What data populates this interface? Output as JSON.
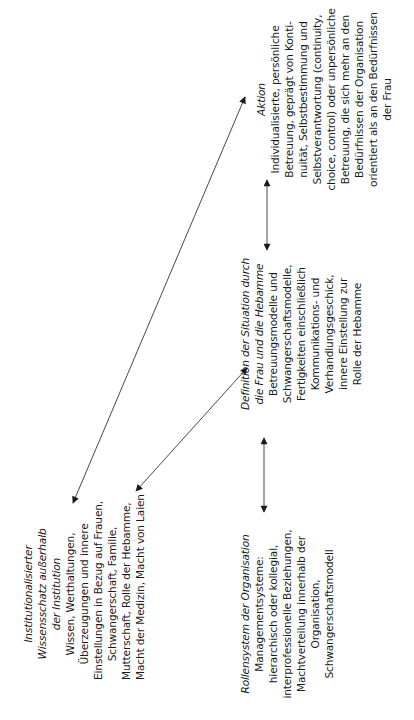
{
  "figure": {
    "orientation": "rotated -90deg (landscape figure printed sideways)",
    "nodes": {
      "institutional_knowledge": {
        "title_lines": [
          "Institutionalisierter",
          "Wissensschatz außerhalb",
          "der Institution"
        ],
        "body_lines": [
          "Wissen, Werthaltungen,",
          "Überzeugungen und innere",
          "Einstellungen in Bezug auf Frauen,",
          "Schwangerschaft, Familie,",
          "Mutterschaft, Rolle der Hebamme,",
          "Macht der Medizin, Macht von Laien"
        ]
      },
      "role_system": {
        "title_lines": [
          "Rollensystem der Organisation"
        ],
        "body_lines": [
          "Managementsysteme:",
          "hierarchisch oder kollegial,",
          "interprofessionelle Beziehungen,",
          "Machtverteilung innerhalb der",
          "Organisation,",
          "Schwangerschaftsmodell"
        ]
      },
      "definition": {
        "title_lines": [
          "Definition der Situation durch",
          "die Frau und die Hebamme"
        ],
        "body_lines": [
          "Betreuungsmodelle und",
          "Schwangerschaftsmodelle,",
          "Fertigkeiten einschließlich",
          "Kommunikations- und",
          "Verhandlungsgeschick,",
          "innere Einstellung zur",
          "Rolle der Hebamme"
        ]
      },
      "action": {
        "title_lines": [
          "Aktion"
        ],
        "body_lines": [
          "Individualisierte, persönliche",
          "Betreuung, geprägt von Konti-",
          "nuität, Selbstbestimmung und",
          "Selbstverantwortung (continuity,",
          "choice, control) oder unpersönliche",
          "Betreuung, die sich mehr an den",
          "Bedürfnissen der Organisation",
          "orientiert als an den Bedürfnissen",
          "der Frau"
        ]
      }
    },
    "edges": [
      {
        "from": "institutional_knowledge",
        "to": "action",
        "type": "bidirectional"
      },
      {
        "from": "institutional_knowledge",
        "to": "definition",
        "type": "bidirectional"
      },
      {
        "from": "role_system",
        "to": "definition",
        "type": "bidirectional"
      },
      {
        "from": "definition",
        "to": "action",
        "type": "bidirectional"
      }
    ],
    "colors": {
      "ink": "#1a1a1a",
      "background": "#ffffff"
    }
  }
}
